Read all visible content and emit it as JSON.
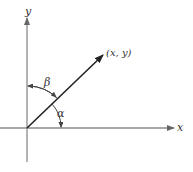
{
  "diagram": {
    "type": "vector-angle-diagram",
    "axes": {
      "x_label": "x",
      "y_label": "y"
    },
    "vector": {
      "label": "(x, y)",
      "from": "origin"
    },
    "angles": [
      {
        "symbol": "α",
        "between": "x-axis and vector"
      },
      {
        "symbol": "β",
        "between": "y-axis and vector"
      }
    ],
    "colors": {
      "axis": "#8a8a8a",
      "vector": "#222222",
      "text": "#333333"
    }
  }
}
